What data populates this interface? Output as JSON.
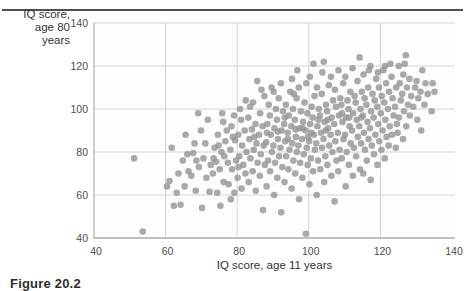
{
  "figure": {
    "caption": "Figure 20.2"
  },
  "chart_data": {
    "type": "scatter",
    "title": "",
    "xlabel": "IQ score, age 11 years",
    "ylabel_line1": "IQ score,",
    "ylabel_line2": "age 80 years",
    "xlim": [
      40,
      140
    ],
    "ylim": [
      40,
      140
    ],
    "x_ticks": [
      "40",
      "60",
      "80",
      "100",
      "120",
      "140"
    ],
    "y_ticks": [
      "140",
      "120",
      "100",
      "80",
      "60",
      "40"
    ],
    "grid": "on",
    "legend": "none",
    "point_color": "#949494",
    "grid_color": "#d4d4d4",
    "axis_color": "#adadad",
    "rule_color": "#4f4f4f",
    "tick_label_color": "#4d4d4d",
    "axis_title_color": "#333333",
    "points": [
      [
        51.2,
        77
      ],
      [
        53.6,
        43
      ],
      [
        60.4,
        64
      ],
      [
        61.1,
        66.5
      ],
      [
        62.3,
        55
      ],
      [
        63.6,
        70
      ],
      [
        64.2,
        55.5
      ],
      [
        64.8,
        76
      ],
      [
        65.3,
        64
      ],
      [
        66.1,
        79
      ],
      [
        61.7,
        82
      ],
      [
        65.6,
        88
      ],
      [
        66.4,
        71
      ],
      [
        63.1,
        61
      ],
      [
        67.2,
        69
      ],
      [
        67.7,
        79.5
      ],
      [
        68.4,
        62
      ],
      [
        68.1,
        84
      ],
      [
        69.3,
        73
      ],
      [
        70.2,
        54
      ],
      [
        70.6,
        77
      ],
      [
        69.9,
        90
      ],
      [
        71.4,
        68
      ],
      [
        71.1,
        84
      ],
      [
        72.3,
        61.5
      ],
      [
        72.6,
        74
      ],
      [
        71.8,
        95
      ],
      [
        69.1,
        98
      ],
      [
        68.6,
        76
      ],
      [
        73.2,
        70
      ],
      [
        73.7,
        82
      ],
      [
        74.4,
        61
      ],
      [
        74.1,
        75.5
      ],
      [
        74.6,
        88
      ],
      [
        75.3,
        55
      ],
      [
        75.1,
        72
      ],
      [
        75.6,
        80
      ],
      [
        76.2,
        66
      ],
      [
        76.7,
        85
      ],
      [
        76.1,
        94
      ],
      [
        77.4,
        75
      ],
      [
        77.1,
        90
      ],
      [
        73.4,
        77
      ],
      [
        77.6,
        65
      ],
      [
        76.4,
        78
      ],
      [
        75.8,
        98
      ],
      [
        74.8,
        83
      ],
      [
        78.2,
        58
      ],
      [
        78.6,
        72
      ],
      [
        78.1,
        81
      ],
      [
        78.4,
        92
      ],
      [
        79.2,
        61
      ],
      [
        79.7,
        76
      ],
      [
        79.4,
        85.5
      ],
      [
        80.1,
        68
      ],
      [
        80.6,
        78
      ],
      [
        80.3,
        88
      ],
      [
        80.8,
        100
      ],
      [
        81.2,
        63
      ],
      [
        81.7,
        74
      ],
      [
        81.4,
        83
      ],
      [
        81.1,
        95
      ],
      [
        82.3,
        70
      ],
      [
        82.6,
        80
      ],
      [
        82.1,
        90
      ],
      [
        82.4,
        104
      ],
      [
        79.1,
        97
      ],
      [
        78.8,
        87
      ],
      [
        80.4,
        73
      ],
      [
        83.2,
        66
      ],
      [
        83.7,
        77
      ],
      [
        83.4,
        86
      ],
      [
        83.1,
        96
      ],
      [
        84.3,
        71
      ],
      [
        84.6,
        81
      ],
      [
        84.1,
        90.5
      ],
      [
        84.4,
        103
      ],
      [
        85.2,
        62
      ],
      [
        85.7,
        75
      ],
      [
        85.4,
        84
      ],
      [
        85.1,
        93
      ],
      [
        85.6,
        113
      ],
      [
        86.3,
        69
      ],
      [
        86.6,
        79
      ],
      [
        86.1,
        88
      ],
      [
        86.4,
        98
      ],
      [
        87.2,
        53
      ],
      [
        87.7,
        74
      ],
      [
        87.4,
        83
      ],
      [
        87.1,
        92
      ],
      [
        87.6,
        106
      ],
      [
        84.8,
        87
      ],
      [
        86.8,
        109
      ],
      [
        83.6,
        101
      ],
      [
        88.2,
        64
      ],
      [
        88.6,
        76
      ],
      [
        88.1,
        84.5
      ],
      [
        88.4,
        93
      ],
      [
        88.8,
        102
      ],
      [
        89.2,
        71
      ],
      [
        89.7,
        80
      ],
      [
        89.4,
        88
      ],
      [
        89.1,
        97
      ],
      [
        89.6,
        110
      ],
      [
        90.3,
        60
      ],
      [
        90.6,
        75
      ],
      [
        90.1,
        83
      ],
      [
        90.4,
        91
      ],
      [
        90.8,
        100
      ],
      [
        91.2,
        68
      ],
      [
        91.7,
        78
      ],
      [
        91.4,
        86
      ],
      [
        91.1,
        95
      ],
      [
        91.6,
        105
      ],
      [
        92.3,
        52
      ],
      [
        92.6,
        73
      ],
      [
        92.1,
        82
      ],
      [
        92.4,
        90
      ],
      [
        92.8,
        99
      ],
      [
        92.2,
        112
      ],
      [
        90.2,
        108
      ],
      [
        88.3,
        89
      ],
      [
        91.3,
        89.5
      ],
      [
        93.2,
        66
      ],
      [
        93.7,
        78
      ],
      [
        93.4,
        85
      ],
      [
        93.1,
        93
      ],
      [
        93.6,
        102
      ],
      [
        94.3,
        72
      ],
      [
        94.6,
        81
      ],
      [
        94.1,
        89
      ],
      [
        94.4,
        97
      ],
      [
        94.8,
        108
      ],
      [
        95.2,
        63
      ],
      [
        95.7,
        76
      ],
      [
        95.4,
        84
      ],
      [
        95.1,
        92
      ],
      [
        95.6,
        100
      ],
      [
        95.3,
        114
      ],
      [
        96.2,
        70
      ],
      [
        96.7,
        80
      ],
      [
        96.4,
        87
      ],
      [
        96.1,
        95
      ],
      [
        96.6,
        105
      ],
      [
        97.3,
        58
      ],
      [
        97.6,
        75
      ],
      [
        97.1,
        83
      ],
      [
        97.4,
        91
      ],
      [
        97.8,
        99
      ],
      [
        97.2,
        110
      ],
      [
        94.2,
        86
      ],
      [
        96.3,
        90.5
      ],
      [
        93.3,
        96
      ],
      [
        95.8,
        107
      ],
      [
        96.8,
        118
      ],
      [
        98.2,
        68
      ],
      [
        98.6,
        79
      ],
      [
        98.1,
        86
      ],
      [
        98.4,
        94
      ],
      [
        98.8,
        103
      ],
      [
        99.2,
        42
      ],
      [
        99.7,
        74
      ],
      [
        99.4,
        82
      ],
      [
        99.1,
        90
      ],
      [
        99.6,
        98
      ],
      [
        99.3,
        112
      ],
      [
        100.2,
        65
      ],
      [
        100.6,
        77
      ],
      [
        100.1,
        85
      ],
      [
        100.4,
        93
      ],
      [
        100.8,
        101
      ],
      [
        100.3,
        115
      ],
      [
        101.2,
        71
      ],
      [
        101.7,
        81
      ],
      [
        101.4,
        88
      ],
      [
        101.1,
        96
      ],
      [
        101.6,
        106
      ],
      [
        101.3,
        121
      ],
      [
        102.2,
        60
      ],
      [
        102.6,
        76
      ],
      [
        102.1,
        84
      ],
      [
        102.4,
        92
      ],
      [
        102.8,
        100
      ],
      [
        102.3,
        110
      ],
      [
        99.8,
        87
      ],
      [
        100.7,
        89
      ],
      [
        98.3,
        91
      ],
      [
        102.7,
        95
      ],
      [
        103.2,
        72
      ],
      [
        103.7,
        82
      ],
      [
        103.4,
        89
      ],
      [
        103.1,
        97
      ],
      [
        103.6,
        107
      ],
      [
        104.3,
        66
      ],
      [
        104.6,
        78
      ],
      [
        104.1,
        86
      ],
      [
        104.4,
        94
      ],
      [
        104.8,
        102
      ],
      [
        104.2,
        122
      ],
      [
        105.2,
        74
      ],
      [
        105.7,
        83
      ],
      [
        105.4,
        91
      ],
      [
        105.1,
        99
      ],
      [
        105.6,
        111
      ],
      [
        106.3,
        69
      ],
      [
        106.6,
        80
      ],
      [
        106.1,
        88
      ],
      [
        106.4,
        96
      ],
      [
        106.8,
        104
      ],
      [
        106.2,
        115
      ],
      [
        107.2,
        57
      ],
      [
        107.7,
        76
      ],
      [
        107.4,
        85
      ],
      [
        107.1,
        93
      ],
      [
        107.6,
        101
      ],
      [
        107.3,
        109
      ],
      [
        104.7,
        90
      ],
      [
        105.3,
        95
      ],
      [
        103.8,
        117
      ],
      [
        108.2,
        71
      ],
      [
        108.6,
        81
      ],
      [
        108.1,
        89
      ],
      [
        108.4,
        97
      ],
      [
        108.8,
        105
      ],
      [
        108.3,
        118
      ],
      [
        109.2,
        77
      ],
      [
        109.7,
        86
      ],
      [
        109.4,
        94
      ],
      [
        109.1,
        102
      ],
      [
        109.6,
        112
      ],
      [
        110.3,
        64
      ],
      [
        110.6,
        80
      ],
      [
        110.1,
        88
      ],
      [
        110.4,
        96
      ],
      [
        110.8,
        104
      ],
      [
        110.2,
        115
      ],
      [
        111.2,
        74
      ],
      [
        111.7,
        84
      ],
      [
        111.4,
        92
      ],
      [
        111.1,
        100
      ],
      [
        111.6,
        108
      ],
      [
        112.3,
        69
      ],
      [
        112.6,
        82
      ],
      [
        112.1,
        90
      ],
      [
        112.4,
        98
      ],
      [
        112.8,
        106
      ],
      [
        112.2,
        119
      ],
      [
        109.3,
        98
      ],
      [
        111.3,
        96
      ],
      [
        113.2,
        78
      ],
      [
        113.7,
        87
      ],
      [
        113.4,
        95
      ],
      [
        113.1,
        103
      ],
      [
        113.6,
        113
      ],
      [
        114.3,
        72
      ],
      [
        114.6,
        84
      ],
      [
        114.1,
        92
      ],
      [
        114.4,
        100
      ],
      [
        114.8,
        108
      ],
      [
        114.2,
        124
      ],
      [
        115.2,
        70
      ],
      [
        115.7,
        81
      ],
      [
        115.4,
        89
      ],
      [
        115.1,
        97
      ],
      [
        115.6,
        105
      ],
      [
        115.3,
        116
      ],
      [
        116.2,
        76
      ],
      [
        116.7,
        86
      ],
      [
        116.4,
        94
      ],
      [
        116.1,
        102
      ],
      [
        116.6,
        110
      ],
      [
        117.3,
        67
      ],
      [
        117.6,
        83
      ],
      [
        117.1,
        91
      ],
      [
        117.4,
        99
      ],
      [
        117.8,
        107
      ],
      [
        117.2,
        120
      ],
      [
        114.7,
        96
      ],
      [
        116.8,
        118
      ],
      [
        118.2,
        79
      ],
      [
        118.6,
        88
      ],
      [
        118.1,
        96
      ],
      [
        118.4,
        104
      ],
      [
        118.8,
        114
      ],
      [
        119.2,
        74
      ],
      [
        119.7,
        85
      ],
      [
        119.4,
        93
      ],
      [
        119.1,
        101
      ],
      [
        119.6,
        110
      ],
      [
        120.3,
        81
      ],
      [
        120.6,
        90
      ],
      [
        120.1,
        98
      ],
      [
        120.4,
        106
      ],
      [
        120.8,
        118
      ],
      [
        121.2,
        77
      ],
      [
        121.7,
        87
      ],
      [
        121.4,
        95
      ],
      [
        121.1,
        103
      ],
      [
        121.6,
        112
      ],
      [
        122.3,
        83
      ],
      [
        122.6,
        92
      ],
      [
        122.1,
        100
      ],
      [
        122.4,
        108
      ],
      [
        122.8,
        121
      ],
      [
        119.3,
        117
      ],
      [
        121.3,
        120
      ],
      [
        123.2,
        88
      ],
      [
        123.7,
        97
      ],
      [
        123.4,
        105
      ],
      [
        123.1,
        115
      ],
      [
        124.3,
        82
      ],
      [
        124.6,
        93
      ],
      [
        124.1,
        101
      ],
      [
        124.4,
        110
      ],
      [
        124.8,
        89
      ],
      [
        125.2,
        96
      ],
      [
        125.7,
        104
      ],
      [
        125.4,
        112
      ],
      [
        125.1,
        120
      ],
      [
        126.3,
        86
      ],
      [
        126.6,
        99
      ],
      [
        126.1,
        107
      ],
      [
        126.4,
        116
      ],
      [
        127.2,
        92
      ],
      [
        127.7,
        102
      ],
      [
        127.4,
        110
      ],
      [
        127.1,
        125
      ],
      [
        128.2,
        97
      ],
      [
        128.6,
        106
      ],
      [
        128.1,
        114
      ],
      [
        126.8,
        121
      ],
      [
        129.2,
        101
      ],
      [
        129.7,
        110
      ],
      [
        130.3,
        95
      ],
      [
        130.6,
        105
      ],
      [
        130.1,
        113
      ],
      [
        131.2,
        108
      ],
      [
        131.7,
        118
      ],
      [
        132.3,
        102
      ],
      [
        132.6,
        112
      ],
      [
        133.2,
        107
      ],
      [
        134.3,
        99
      ],
      [
        134.6,
        112
      ],
      [
        135.1,
        108
      ],
      [
        131.4,
        90
      ]
    ]
  }
}
